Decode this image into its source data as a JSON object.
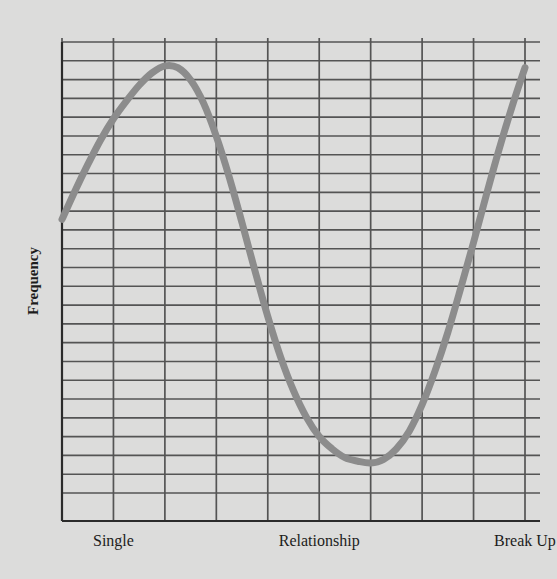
{
  "chart_data": {
    "type": "line",
    "title": "",
    "subtitle": "",
    "xlabel": "",
    "ylabel": "Frequency",
    "grid": true,
    "legend": false,
    "legend_position": "none",
    "annotations": [],
    "xlim": [
      0,
      9
    ],
    "ylim": [
      0,
      25.55
    ],
    "xticks": [
      1,
      5,
      9
    ],
    "xtick_labels": [
      "Single",
      "Relationship",
      "Break Up"
    ],
    "yticks": [],
    "ytick_labels": [],
    "x_gridline_count": 10,
    "y_gridline_count": 25,
    "series": [
      {
        "name": "Frequency",
        "color": "#8c8c8c",
        "line_width": 7,
        "x": [
          0.0,
          0.25,
          0.5,
          0.75,
          1.0,
          1.25,
          1.5,
          1.75,
          2.0,
          2.25,
          2.5,
          2.75,
          3.0,
          3.25,
          3.5,
          3.75,
          4.0,
          4.25,
          4.5,
          4.75,
          5.0,
          5.25,
          5.5,
          5.75,
          6.0,
          6.25,
          6.5,
          6.75,
          7.0,
          7.25,
          7.5,
          7.75,
          8.0,
          8.25,
          8.5,
          8.75,
          9.0
        ],
        "y": [
          15.5,
          17.1,
          18.6,
          20.0,
          21.2,
          22.2,
          23.1,
          23.8,
          24.2,
          24.1,
          23.4,
          22.1,
          20.2,
          17.9,
          15.3,
          12.6,
          10.0,
          7.7,
          5.8,
          4.3,
          3.2,
          2.5,
          2.0,
          1.8,
          1.7,
          1.9,
          2.5,
          3.5,
          5.0,
          6.9,
          9.1,
          11.6,
          14.2,
          16.9,
          19.5,
          21.9,
          24.1
        ]
      }
    ],
    "key_points": [
      {
        "label": "start",
        "x": 0.0,
        "y": 15.5
      },
      {
        "label": "peak",
        "x": 2.0,
        "y": 24.2
      },
      {
        "label": "trough",
        "x": 6.0,
        "y": 1.7
      },
      {
        "label": "end",
        "x": 9.0,
        "y": 24.1
      }
    ],
    "colors": {
      "background": "#dcdcdb",
      "plot_background": "#dcdcdb",
      "grid_line": "#545454",
      "axis_line": "#2b2b2b",
      "curve": "#8c8c8c",
      "text": "#1c1c1c"
    }
  },
  "axes": {
    "y_axis_label": "Frequency",
    "x_tick_labels": [
      {
        "text": "Single",
        "x_value": 1
      },
      {
        "text": "Relationship",
        "x_value": 5
      },
      {
        "text": "Break Up",
        "x_value": 9
      }
    ]
  }
}
